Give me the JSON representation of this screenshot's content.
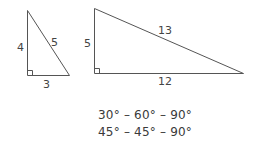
{
  "diagram": {
    "triangle_a": {
      "sides": {
        "vertical": "4",
        "hypotenuse": "5",
        "base": "3"
      },
      "right_angle_marker": true
    },
    "triangle_b": {
      "sides": {
        "vertical": "5",
        "hypotenuse": "13",
        "base": "12"
      },
      "right_angle_marker": true
    },
    "special_triangles": [
      "30° – 60° – 90°",
      "45° – 45° – 90°"
    ],
    "colors": {
      "stroke": "#555555",
      "text": "#3a3a3a"
    }
  }
}
